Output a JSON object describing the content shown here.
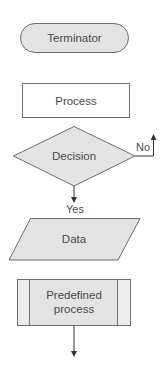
{
  "diagram": {
    "type": "flowchart-symbol-legend",
    "colors": {
      "stroke": "#6e6e6e",
      "shaded_fill": "#e3e3e3",
      "white_fill": "#ffffff",
      "text": "#4a4a4a",
      "arrow": "#333333"
    },
    "nodes": [
      {
        "id": "terminator",
        "shape": "terminator",
        "label": "Terminator"
      },
      {
        "id": "process",
        "shape": "process",
        "label": "Process"
      },
      {
        "id": "decision",
        "shape": "decision",
        "label": "Decision"
      },
      {
        "id": "data",
        "shape": "data",
        "label": "Data"
      },
      {
        "id": "predefined",
        "shape": "predefined-process",
        "label_line1": "Predefined",
        "label_line2": "process"
      }
    ],
    "edges": [
      {
        "from": "decision",
        "direction": "right-then-up",
        "label": "No"
      },
      {
        "from": "decision",
        "to": "data",
        "direction": "down",
        "label": "Yes"
      },
      {
        "from": "predefined",
        "direction": "down",
        "label": ""
      }
    ]
  }
}
